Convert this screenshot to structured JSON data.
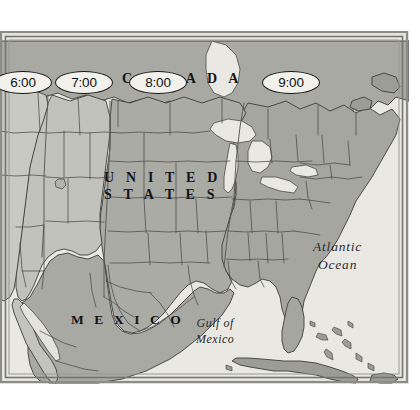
{
  "figure": {
    "kind": "map",
    "background_color": "#ffffff"
  },
  "map": {
    "frame": {
      "border_color": "#8d8d88",
      "inner_border_color": "#6e6e69"
    },
    "colors": {
      "ocean": "#e9e8e3",
      "lake": "#f0efea",
      "zone_pacific": "#c9c9c4",
      "zone_mountain": "#c2c2bd",
      "zone_central": "#ababa6",
      "zone_eastern": "#a6a6a1",
      "mexico_land": "#a9a9a4",
      "canada_land": "#a9a9a4",
      "islands": "#9d9d98",
      "border_line": "#4a4a48",
      "coast_line": "#3c3c3a",
      "label_text": "#141416",
      "oval_fill": "#f2f1ec",
      "oval_stroke": "#18181a"
    },
    "time_zone_labels": [
      {
        "name": "pacific-time-label",
        "text": "6:00",
        "x": -6,
        "y": 40
      },
      {
        "name": "mountain-time-label",
        "text": "7:00",
        "x": 55,
        "y": 40
      },
      {
        "name": "central-time-label",
        "text": "8:00",
        "x": 129,
        "y": 40
      },
      {
        "name": "eastern-time-label",
        "text": "9:00",
        "x": 262,
        "y": 40
      }
    ],
    "country_labels": {
      "canada": "C A N A D A",
      "united_states_line1": "U N I T E D",
      "united_states_line2": "S T A T E S",
      "mexico": "M E X I C O"
    },
    "water_labels": {
      "atlantic_line1": "Atlantic",
      "atlantic_line2": "Ocean",
      "gulf_line1": "Gulf of",
      "gulf_line2": "Mexico"
    }
  }
}
